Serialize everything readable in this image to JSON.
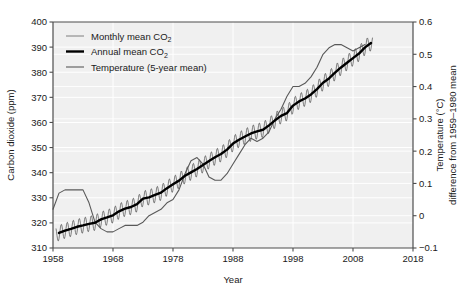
{
  "chart_data": {
    "type": "line",
    "title": "",
    "xlabel": "Year",
    "ylabel": "Carbon dioxide (ppm)",
    "y2label_line1": "Temperature (°C)",
    "y2label_line2": "difference from 1959–1980 mean",
    "xlim": [
      1958,
      2018
    ],
    "ylim": [
      310,
      400
    ],
    "y2lim": [
      -0.1,
      0.6
    ],
    "xticks": [
      1958,
      1968,
      1978,
      1988,
      1998,
      2008,
      2018
    ],
    "xtick_labels": [
      "1958",
      "1968",
      "1978",
      "1988",
      "1998",
      "2008",
      "2018"
    ],
    "yticks": [
      310,
      320,
      330,
      340,
      350,
      360,
      370,
      380,
      390,
      400
    ],
    "ytick_labels": [
      "310",
      "320",
      "330",
      "340",
      "350",
      "360",
      "370",
      "380",
      "390",
      "400"
    ],
    "y2ticks": [
      -0.1,
      0,
      0.1,
      0.2,
      0.3,
      0.4,
      0.5,
      0.6
    ],
    "y2tick_labels": [
      "−0.1",
      "0",
      "0.1",
      "0.2",
      "0.3",
      "0.4",
      "0.5",
      "0.6"
    ],
    "grid": true,
    "legend_position": "upper left",
    "plot_bgcolor": "#f0f0f0",
    "grid_color": "#ffffff",
    "series": [
      {
        "name": "Monthly mean CO2",
        "label_main": "Monthly mean CO",
        "label_sub": "2",
        "axis": "left",
        "color": "#606060",
        "width": 0.8,
        "type": "sawtooth_about_annual",
        "amplitude_ppm": 3.1,
        "phase_peak_month": 0.38
      },
      {
        "name": "Annual mean CO2",
        "label_main": "Annual mean CO",
        "label_sub": "2",
        "axis": "left",
        "color": "#000000",
        "width": 2.4,
        "x": [
          1959,
          1960,
          1961,
          1962,
          1963,
          1964,
          1965,
          1966,
          1967,
          1968,
          1969,
          1970,
          1971,
          1972,
          1973,
          1974,
          1975,
          1976,
          1977,
          1978,
          1979,
          1980,
          1981,
          1982,
          1983,
          1984,
          1985,
          1986,
          1987,
          1988,
          1989,
          1990,
          1991,
          1992,
          1993,
          1994,
          1995,
          1996,
          1997,
          1998,
          1999,
          2000,
          2001,
          2002,
          2003,
          2004,
          2005,
          2006,
          2007,
          2008,
          2009,
          2010,
          2011
        ],
        "values": [
          315.98,
          316.91,
          317.64,
          318.45,
          318.99,
          319.62,
          320.04,
          321.38,
          322.16,
          323.04,
          324.62,
          325.68,
          326.32,
          327.45,
          329.68,
          330.18,
          331.11,
          332.04,
          333.83,
          335.4,
          336.84,
          338.75,
          340.11,
          341.45,
          343.05,
          344.65,
          346.12,
          347.42,
          349.19,
          351.57,
          353.12,
          354.39,
          355.61,
          356.45,
          357.1,
          358.83,
          360.82,
          362.61,
          363.73,
          366.7,
          368.38,
          369.55,
          371.14,
          373.28,
          375.8,
          377.52,
          379.8,
          381.9,
          383.79,
          385.6,
          387.43,
          389.9,
          391.65
        ]
      },
      {
        "name": "Temperature (5-year mean)",
        "label_main": "Temperature (5-year mean)",
        "label_sub": "",
        "axis": "right",
        "color": "#595959",
        "width": 1.1,
        "x": [
          1958,
          1959,
          1960,
          1961,
          1962,
          1963,
          1964,
          1965,
          1966,
          1967,
          1968,
          1969,
          1970,
          1971,
          1972,
          1973,
          1974,
          1975,
          1976,
          1977,
          1978,
          1979,
          1980,
          1981,
          1982,
          1983,
          1984,
          1985,
          1986,
          1987,
          1988,
          1989,
          1990,
          1991,
          1992,
          1993,
          1994,
          1995,
          1996,
          1997,
          1998,
          1999,
          2000,
          2001,
          2002,
          2003,
          2004,
          2005,
          2006,
          2007,
          2008,
          2009,
          2010
        ],
        "values": [
          0.02,
          0.07,
          0.08,
          0.08,
          0.08,
          0.08,
          0.04,
          -0.02,
          -0.04,
          -0.05,
          -0.05,
          -0.04,
          -0.03,
          -0.03,
          -0.03,
          -0.02,
          0.0,
          0.01,
          0.02,
          0.04,
          0.05,
          0.08,
          0.13,
          0.17,
          0.18,
          0.16,
          0.12,
          0.11,
          0.11,
          0.13,
          0.16,
          0.19,
          0.22,
          0.24,
          0.23,
          0.24,
          0.26,
          0.3,
          0.33,
          0.37,
          0.4,
          0.4,
          0.41,
          0.43,
          0.46,
          0.5,
          0.52,
          0.53,
          0.53,
          0.52,
          0.51,
          0.52,
          0.53
        ]
      }
    ]
  },
  "axes": {
    "left_title": "Carbon dioxide (ppm)",
    "bottom_title": "Year",
    "right_title_line1": "Temperature (°C)",
    "right_title_line2": "difference from 1959–1980 mean"
  },
  "legend": {
    "items": [
      {
        "label_main": "Monthly mean CO",
        "label_sub": "2",
        "swatch": "monthly-line-swatch"
      },
      {
        "label_main": "Annual mean CO",
        "label_sub": "2",
        "swatch": "annual-line-swatch"
      },
      {
        "label_main": "Temperature (5-year mean)",
        "label_sub": "",
        "swatch": "temperature-line-swatch"
      }
    ]
  }
}
